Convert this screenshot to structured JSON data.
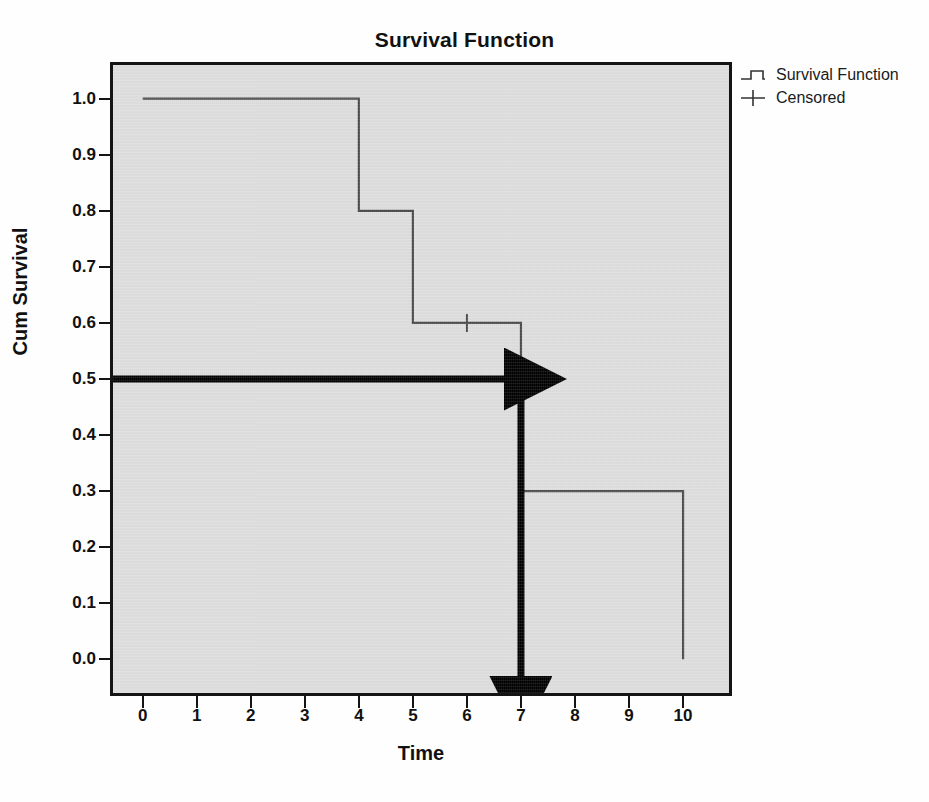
{
  "chart_data": {
    "type": "line",
    "title": "Survival Function",
    "xlabel": "Time",
    "ylabel": "Cum Survival",
    "xlim": [
      -0.55,
      10.85
    ],
    "ylim": [
      -0.06,
      1.06
    ],
    "grid": false,
    "legend_position": "top-right-outside",
    "x_ticks": [
      "0",
      "1",
      "2",
      "3",
      "4",
      "5",
      "6",
      "7",
      "8",
      "9",
      "10"
    ],
    "x_tick_values": [
      0,
      1,
      2,
      3,
      4,
      5,
      6,
      7,
      8,
      9,
      10
    ],
    "y_ticks": [
      "0.0",
      "0.1",
      "0.2",
      "0.3",
      "0.4",
      "0.5",
      "0.6",
      "0.7",
      "0.8",
      "0.9",
      "1.0"
    ],
    "y_tick_values": [
      0.0,
      0.1,
      0.2,
      0.3,
      0.4,
      0.5,
      0.6,
      0.7,
      0.8,
      0.9,
      1.0
    ],
    "series": [
      {
        "name": "Survival Function",
        "style": "step-post",
        "color": "#4a4a4a",
        "x": [
          0,
          4,
          4,
          5,
          5,
          7,
          7,
          10,
          10
        ],
        "y": [
          1.0,
          1.0,
          0.8,
          0.8,
          0.6,
          0.6,
          0.3,
          0.3,
          0.0
        ],
        "steps": [
          {
            "time": 0,
            "survival": 1.0
          },
          {
            "time": 4,
            "survival": 0.8
          },
          {
            "time": 5,
            "survival": 0.6
          },
          {
            "time": 7,
            "survival": 0.3
          },
          {
            "time": 10,
            "survival": 0.0
          }
        ]
      },
      {
        "name": "Censored",
        "style": "marker-plus",
        "color": "#4a4a4a",
        "points": [
          {
            "time": 6,
            "survival": 0.6
          }
        ]
      }
    ],
    "annotations": [
      {
        "name": "median-survival-horizontal-arrow",
        "type": "arrow",
        "from": {
          "x": -0.55,
          "y": 0.5
        },
        "to": {
          "x": 7,
          "y": 0.5
        },
        "color": "#000000"
      },
      {
        "name": "median-survival-vertical-arrow",
        "type": "arrow",
        "from": {
          "x": 7,
          "y": 0.5
        },
        "to": {
          "x": 7,
          "y": -0.06
        },
        "color": "#000000"
      }
    ]
  },
  "legend": {
    "items": [
      {
        "label": "Survival Function",
        "icon": "step-line-icon"
      },
      {
        "label": "Censored",
        "icon": "plus-marker-icon"
      }
    ]
  },
  "colors": {
    "plot_background": "#dedede",
    "frame": "#141414",
    "curve": "#4a4a4a",
    "annotation": "#000000",
    "text": "#111111",
    "page_background": "#fefefe"
  }
}
